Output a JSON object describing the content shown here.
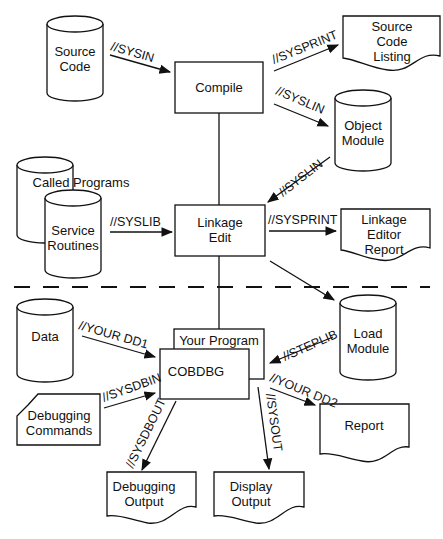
{
  "diagram": {
    "nodes": {
      "source_code": {
        "lines": [
          "Source",
          "Code"
        ],
        "shape": "cylinder"
      },
      "compile": {
        "lines": [
          "Compile"
        ],
        "shape": "box"
      },
      "source_listing": {
        "lines": [
          "Source",
          "Code",
          "Listing"
        ],
        "shape": "document"
      },
      "object_module": {
        "lines": [
          "Object",
          "Module"
        ],
        "shape": "cylinder"
      },
      "called_programs": {
        "lines": [
          "Called Programs"
        ],
        "shape": "cylinder"
      },
      "service_routines": {
        "lines": [
          "Service",
          "Routines"
        ],
        "shape": "cylinder"
      },
      "linkage_edit": {
        "lines": [
          "Linkage",
          "Edit"
        ],
        "shape": "box"
      },
      "linkage_report": {
        "lines": [
          "Linkage",
          "Editor",
          "Report"
        ],
        "shape": "document"
      },
      "load_module": {
        "lines": [
          "Load",
          "Module"
        ],
        "shape": "cylinder"
      },
      "data": {
        "lines": [
          "Data"
        ],
        "shape": "cylinder"
      },
      "your_program": {
        "lines": [
          "Your Program"
        ],
        "shape": "box"
      },
      "cobdbg": {
        "lines": [
          "COBDBG"
        ],
        "shape": "box"
      },
      "debug_commands": {
        "lines": [
          "Debugging",
          "Commands"
        ],
        "shape": "card"
      },
      "report": {
        "lines": [
          "Report"
        ],
        "shape": "document"
      },
      "debug_output": {
        "lines": [
          "Debugging",
          "Output"
        ],
        "shape": "document"
      },
      "display_output": {
        "lines": [
          "Display",
          "Output"
        ],
        "shape": "document"
      }
    },
    "edges": {
      "sysin": "//SYSIN",
      "sysprint1": "//SYSPRINT",
      "syslin1": "//SYSLIN",
      "syslin2": "//SYSLIN",
      "syslib": "//SYSLIB",
      "sysprint2": "//SYSPRINT",
      "yourdd1": "//YOUR DD1",
      "steplib": "//STEPLIB",
      "sysdbin": "//SYSDBIN",
      "yourdd2": "//YOUR DD2",
      "sysdbout": "//SYSDBOUT",
      "sysout": "//SYSOUT"
    },
    "colors": {
      "ink": "#111111",
      "background": "#ffffff"
    }
  }
}
